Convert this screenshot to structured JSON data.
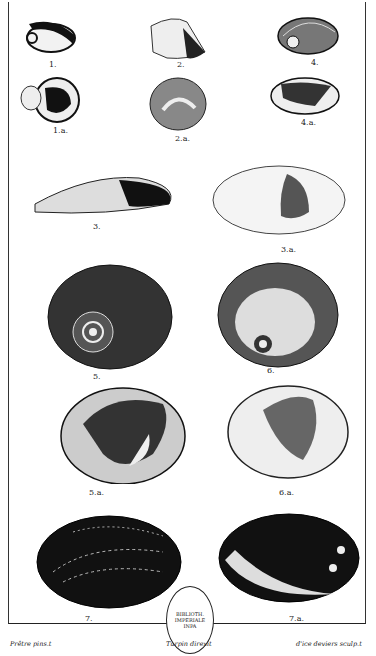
{
  "plate": {
    "figures": [
      {
        "id": "1",
        "label": "1."
      },
      {
        "id": "1a",
        "label": "1.a."
      },
      {
        "id": "2",
        "label": "2."
      },
      {
        "id": "2a",
        "label": "2.a."
      },
      {
        "id": "4",
        "label": "4."
      },
      {
        "id": "4a",
        "label": "4.a."
      },
      {
        "id": "3",
        "label": "3."
      },
      {
        "id": "3a",
        "label": "3.a."
      },
      {
        "id": "5",
        "label": "5."
      },
      {
        "id": "6",
        "label": "6."
      },
      {
        "id": "5a",
        "label": "5.a."
      },
      {
        "id": "6a",
        "label": "6.a."
      },
      {
        "id": "7",
        "label": "7."
      },
      {
        "id": "7a",
        "label": "7.a."
      }
    ],
    "credits": {
      "left": "Prêtre pins.t",
      "center": "Turpin direxit",
      "right": "d'ice deviers sculp.t"
    },
    "stamp": "BIBLIOTH. IMPERIALE INPA"
  }
}
